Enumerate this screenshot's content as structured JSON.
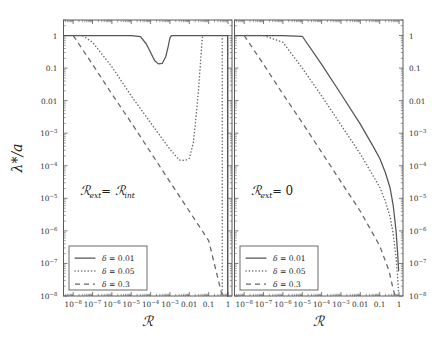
{
  "figure": {
    "type": "line-loglog-multipanel",
    "background": "#ffffff",
    "line_color": "#555555",
    "axis_color": "#5a5a5a"
  },
  "chart_data": {
    "type": "line",
    "title": "",
    "xlabel": "ℛ",
    "ylabel": "λ*/a",
    "xscale": "log",
    "yscale": "log",
    "xlim": [
      3.16e-09,
      1.6
    ],
    "ylim": [
      1e-08,
      3.0
    ],
    "grid": false,
    "legend_position": "lower-left",
    "xticklabels": [
      "10−8",
      "10−7",
      "10−6",
      "10−5",
      "10−4",
      "10−3",
      "0.01",
      "0.1",
      "1"
    ],
    "xtickvalues": [
      1e-08,
      1e-07,
      1e-06,
      1e-05,
      0.0001,
      0.001,
      0.01,
      0.1,
      1
    ],
    "yticklabels": [
      "1",
      "0.1",
      "0.01",
      "10−3",
      "10−4",
      "10−5",
      "10−6",
      "10−7",
      "10−8"
    ],
    "ytickvalues": [
      1,
      0.1,
      0.01,
      0.001,
      0.0001,
      1e-05,
      1e-06,
      1e-07,
      1e-08
    ],
    "panels": [
      {
        "id": "left",
        "annotation": "ℛₑₓₜ = ℛᵢₙₜ",
        "annotation_plain": "R_ext = R_int",
        "ylabels_side": "left",
        "series": [
          {
            "name": "δ = 0.01",
            "style": "solid",
            "x": [
              3.16e-09,
              1e-08,
              1e-07,
              1e-06,
              1e-05,
              3e-05,
              6e-05,
              0.0001,
              0.00016,
              0.00025,
              0.0004,
              0.0006,
              0.0008,
              0.001,
              0.0012,
              0.002,
              0.01,
              0.1,
              0.5,
              0.9,
              0.95,
              0.95
            ],
            "y": [
              1,
              1,
              1,
              1,
              1,
              0.92,
              0.55,
              0.3,
              0.17,
              0.135,
              0.14,
              0.22,
              0.45,
              0.85,
              1,
              1,
              1,
              1,
              1,
              1,
              1,
              1e-08
            ]
          },
          {
            "name": "δ = 0.05",
            "style": "dotted",
            "x": [
              1e-08,
              3e-08,
              1e-07,
              1e-06,
              1e-05,
              0.0001,
              0.001,
              0.003,
              0.006,
              0.01,
              0.016,
              0.022,
              0.03,
              0.04,
              0.045,
              0.048,
              0.05,
              0.05
            ],
            "y": [
              1,
              1,
              0.62,
              0.11,
              0.014,
              0.0021,
              0.00032,
              0.00015,
              0.000145,
              0.00017,
              0.0005,
              0.003,
              0.022,
              0.25,
              0.65,
              0.92,
              1,
              1
            ],
            "note": "vertical tail down to 1e-8 at x approx 0.5"
          },
          {
            "name": "δ = 0.3",
            "style": "dashed",
            "x": [
              1e-08,
              1e-07,
              1e-06,
              1e-05,
              0.0001,
              0.001,
              0.01,
              0.1,
              0.5
            ],
            "y": [
              1,
              0.13,
              0.016,
              0.0021,
              0.00026,
              3.2e-05,
              4e-06,
              5e-07,
              1e-08
            ]
          }
        ]
      },
      {
        "id": "right",
        "annotation": "ℛₑₓₜ = 0",
        "annotation_plain": "R_ext = 0",
        "ylabels_side": "right",
        "series": [
          {
            "name": "δ = 0.01",
            "style": "solid",
            "x": [
              3.16e-09,
              1e-08,
              1e-07,
              1e-06,
              1e-05,
              0.0001,
              0.001,
              0.01,
              0.05,
              0.1,
              0.2,
              0.35,
              0.5,
              0.7,
              0.85,
              0.95
            ],
            "y": [
              1,
              1,
              1,
              1,
              0.95,
              0.13,
              0.016,
              0.0019,
              0.00036,
              0.00017,
              6e-05,
              2e-05,
              6e-06,
              1e-06,
              2e-07,
              6e-08
            ]
          },
          {
            "name": "δ = 0.05",
            "style": "dotted",
            "x": [
              1e-08,
              1e-07,
              1e-06,
              1e-05,
              0.0001,
              0.001,
              0.01,
              0.05,
              0.1,
              0.2,
              0.35,
              0.5,
              0.7,
              0.85,
              0.95
            ],
            "y": [
              1,
              1,
              0.62,
              0.1,
              0.014,
              0.0018,
              0.00023,
              4.5e-05,
              2.2e-05,
              8e-06,
              2.6e-06,
              8e-07,
              1.6e-07,
              3.5e-08,
              1.2e-08
            ]
          },
          {
            "name": "δ = 0.3",
            "style": "dashed",
            "x": [
              1e-08,
              1e-07,
              1e-06,
              1e-05,
              0.0001,
              0.001,
              0.01,
              0.1,
              0.3,
              0.5,
              0.62
            ],
            "y": [
              1,
              0.13,
              0.016,
              0.0021,
              0.00026,
              3.2e-05,
              4e-06,
              3.5e-07,
              6e-08,
              1.6e-08,
              1e-08
            ]
          }
        ]
      }
    ],
    "legend": {
      "entries": [
        {
          "label": "δ = 0.01",
          "style": "solid"
        },
        {
          "label": "δ = 0.05",
          "style": "dotted"
        },
        {
          "label": "δ = 0.3",
          "style": "dashed"
        }
      ]
    }
  }
}
